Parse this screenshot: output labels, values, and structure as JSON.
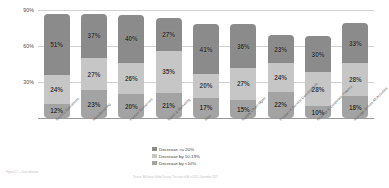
{
  "chart_data": {
    "type": "bar",
    "subtype": "stacked-column",
    "title": "",
    "xlabel": "",
    "ylabel": "",
    "ylim": [
      0,
      90
    ],
    "yticks": [
      30,
      60,
      90
    ],
    "ytick_labels": [
      "30%",
      "60%",
      "90%"
    ],
    "grid": true,
    "legend_position": "bottom-center",
    "categories": [
      "Service Operations",
      "Manufacturing",
      "Human Resources",
      "Sales & Marketing",
      "Risk",
      "Supply Chain Mgmt",
      "Product & Service Development",
      "Strategy & Corporate Finance",
      "Average Across All Activities"
    ],
    "series": [
      {
        "name": "Decrease >= 20%",
        "color": "#8b8b8b",
        "values": [
          51,
          37,
          40,
          27,
          41,
          36,
          23,
          30,
          33
        ]
      },
      {
        "name": "Decrease by 10-19%",
        "color": "#c6c6c6",
        "values": [
          24,
          27,
          26,
          35,
          20,
          27,
          24,
          28,
          28
        ]
      },
      {
        "name": "Decrease by <10%",
        "color": "#a3a3a3",
        "values": [
          12,
          23,
          20,
          21,
          17,
          15,
          22,
          10,
          18
        ]
      }
    ],
    "stack_order_top_to_bottom": [
      "Decrease >= 20%",
      "Decrease by 10-19%",
      "Decrease by <10%"
    ],
    "value_labels": [
      [
        "51%",
        "24%",
        "12%"
      ],
      [
        "37%",
        "27%",
        "23%"
      ],
      [
        "40%",
        "26%",
        "20%"
      ],
      [
        "27%",
        "35%",
        "21%"
      ],
      [
        "41%",
        "20%",
        "17%"
      ],
      [
        "36%",
        "27%",
        "15%"
      ],
      [
        "23%",
        "24%",
        "22%"
      ],
      [
        "30%",
        "28%",
        "10%"
      ],
      [
        "33%",
        "28%",
        "18%"
      ]
    ]
  },
  "legend": {
    "items": [
      {
        "label": "Decrease >= 20%",
        "color": "#8b8b8b"
      },
      {
        "label": "Decrease by 10-19%",
        "color": "#c6c6c6"
      },
      {
        "label": "Decrease by <10%",
        "color": "#a3a3a3"
      }
    ]
  },
  "footer": {
    "left": "Figure 2.7 — Cost reduction",
    "right": "Source: McKinsey Global Survey, The state of AI in 2021, December 2021"
  },
  "axes": {
    "y_ticks": [
      "90%",
      "60%",
      "30%"
    ]
  }
}
